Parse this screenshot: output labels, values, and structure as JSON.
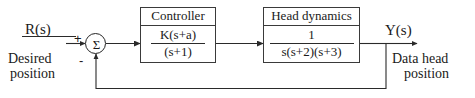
{
  "diagram": {
    "type": "control-system-block-diagram",
    "input_signal": {
      "name": "R(s)",
      "description_line1": "Desired",
      "description_line2": "position"
    },
    "output_signal": {
      "name": "Y(s)",
      "description_line1": "Data head",
      "description_line2": "position"
    },
    "summing_junction": {
      "symbol": "Σ",
      "input_sign": "+",
      "feedback_sign": "-"
    },
    "blocks": [
      {
        "id": "controller",
        "title": "Controller",
        "numerator": "K(s+a)",
        "denominator": "(s+1)"
      },
      {
        "id": "head-dynamics",
        "title": "Head dynamics",
        "numerator": "1",
        "denominator": "s(s+2)(s+3)"
      }
    ],
    "feedback": {
      "type": "unity-negative-feedback",
      "gain": "1"
    },
    "colors": {
      "line": "#2a2a2a",
      "block_border": "#3a3a3a",
      "text": "#1a1a1a",
      "background": "#ffffff"
    }
  }
}
